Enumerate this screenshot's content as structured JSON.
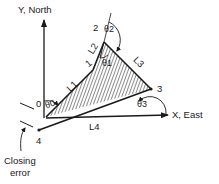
{
  "axes": {
    "y_label": "Y, North",
    "x_label": "X, East"
  },
  "vertices": {
    "v0": "0",
    "v1": "1",
    "v2": "2",
    "v3": "3",
    "v4": "4"
  },
  "legs": {
    "l1": "L1",
    "l2": "L2",
    "l3": "L3",
    "l4": "L4"
  },
  "angles": {
    "theta0": "θ0",
    "theta1": "θ1",
    "theta2": "θ2",
    "theta3": "θ3"
  },
  "closing_error": {
    "line1": "Closing",
    "line2": "error"
  },
  "colors": {
    "ink": "#1a1a1a",
    "background": "#ffffff"
  }
}
